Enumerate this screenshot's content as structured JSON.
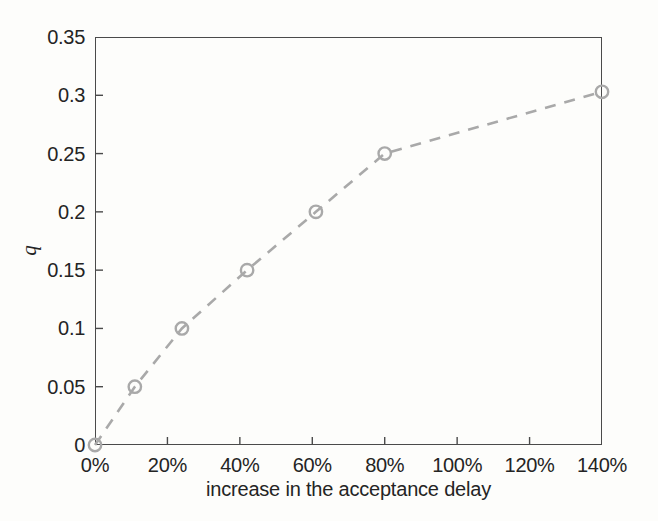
{
  "chart_data": {
    "type": "line",
    "title": "",
    "subtitle": "",
    "xlabel": "increase in the acceptance delay",
    "ylabel": "q",
    "xlim": [
      0,
      140
    ],
    "ylim": [
      0,
      0.35
    ],
    "grid": false,
    "legend": null,
    "x_tick_labels": [
      "0%",
      "20%",
      "40%",
      "60%",
      "80%",
      "100%",
      "120%",
      "140%"
    ],
    "x_tick_values": [
      0,
      20,
      40,
      60,
      80,
      100,
      120,
      140
    ],
    "y_tick_labels": [
      "0",
      "0.05",
      "0.1",
      "0.15",
      "0.2",
      "0.25",
      "0.3",
      "0.35"
    ],
    "y_tick_values": [
      0,
      0.05,
      0.1,
      0.15,
      0.2,
      0.25,
      0.3,
      0.35
    ],
    "series": [
      {
        "name": "q",
        "line_style": "dashed",
        "marker": "circle-open",
        "color": "#a9a9a9",
        "x": [
          0,
          11,
          24,
          42,
          61,
          80,
          140
        ],
        "y": [
          0,
          0.05,
          0.1,
          0.15,
          0.2,
          0.25,
          0.303
        ],
        "points": [
          {
            "x": 0,
            "y": 0,
            "x_label": "0%",
            "y_label": "0"
          },
          {
            "x": 11,
            "y": 0.05,
            "x_label": "11%",
            "y_label": "0.05"
          },
          {
            "x": 24,
            "y": 0.1,
            "x_label": "24%",
            "y_label": "0.1"
          },
          {
            "x": 42,
            "y": 0.15,
            "x_label": "42%",
            "y_label": "0.15"
          },
          {
            "x": 61,
            "y": 0.2,
            "x_label": "61%",
            "y_label": "0.2"
          },
          {
            "x": 80,
            "y": 0.25,
            "x_label": "80%",
            "y_label": "0.25"
          },
          {
            "x": 140,
            "y": 0.303,
            "x_label": "140%",
            "y_label": "0.303"
          }
        ]
      }
    ],
    "colors": {
      "series": "#a9a9a9",
      "axis": "#4a4a4a",
      "text": "#242424",
      "background": "#fdfdfb"
    }
  },
  "axis": {
    "y_ticks": [
      {
        "label": "0.35",
        "value": 0.35
      },
      {
        "label": "0.3",
        "value": 0.3
      },
      {
        "label": "0.25",
        "value": 0.25
      },
      {
        "label": "0.2",
        "value": 0.2
      },
      {
        "label": "0.15",
        "value": 0.15
      },
      {
        "label": "0.1",
        "value": 0.1
      },
      {
        "label": "0.05",
        "value": 0.05
      },
      {
        "label": "0",
        "value": 0
      }
    ],
    "x_ticks": [
      {
        "label": "0%",
        "value": 0
      },
      {
        "label": "20%",
        "value": 20
      },
      {
        "label": "40%",
        "value": 40
      },
      {
        "label": "60%",
        "value": 60
      },
      {
        "label": "80%",
        "value": 80
      },
      {
        "label": "100%",
        "value": 100
      },
      {
        "label": "120%",
        "value": 120
      },
      {
        "label": "140%",
        "value": 140
      }
    ],
    "x_title": "increase in the acceptance delay",
    "y_title": "q"
  }
}
